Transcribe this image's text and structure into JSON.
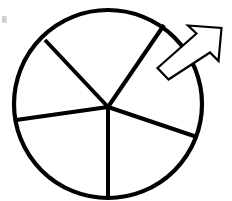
{
  "figure": {
    "kind": "pie-spinner-diagram",
    "width": 232,
    "height": 201,
    "background_color": "#ffffff",
    "stroke_color": "#000000",
    "title": "",
    "caption": ""
  },
  "chart_data": {
    "type": "pie",
    "title": "",
    "subtitle": "",
    "xlabel": "",
    "ylabel": "",
    "grid": false,
    "legend_position": "none",
    "slice_count": 5,
    "labels": [
      "sector-1",
      "sector-2",
      "sector-3",
      "sector-4",
      "sector-5"
    ],
    "values": [
      25,
      14,
      17,
      22,
      22
    ],
    "slice_fill": "#ffffff",
    "slice_stroke": "#000000",
    "boundary_angles_deg": [
      133,
      227,
      292,
      360,
      67
    ],
    "annotations": [
      {
        "name": "spinner-arrow",
        "text": "",
        "direction_deg": 42,
        "style": "hollow-outlined-arrow"
      }
    ]
  },
  "circle": {
    "center_x": 108,
    "center_y": 104,
    "radius_x": 94,
    "radius_y": 94,
    "stroke_width": 4.2,
    "fill": "#ffffff",
    "stroke": "#000000"
  },
  "hub": {
    "x": 108,
    "y": 107
  },
  "spokes": [
    {
      "name": "spoke-upper-left",
      "end_x": 45,
      "end_y": 40,
      "stroke_width": 4.0
    },
    {
      "name": "spoke-upper-right",
      "end_x": 164,
      "end_y": 25,
      "stroke_width": 4.0
    },
    {
      "name": "spoke-left",
      "end_x": 16,
      "end_y": 120,
      "stroke_width": 4.0
    },
    {
      "name": "spoke-lower-right",
      "end_x": 197,
      "end_y": 137,
      "stroke_width": 4.0
    },
    {
      "name": "spoke-bottom",
      "end_x": 108,
      "end_y": 197,
      "stroke_width": 4.0
    }
  ],
  "arrow": {
    "name": "spinner-arrow",
    "fill": "#ffffff",
    "stroke": "#000000",
    "stroke_width": 2.2,
    "points": "168.5,79.5 158.5,68.5 196.0,34.5 188.5,27.0 220.5,29.5 217.0,60.5 209.5,53.0 ",
    "tip_x": 219,
    "tip_y": 31,
    "tail_x": 168,
    "tail_y": 79
  },
  "corner_mark": {
    "name": "corner-speck",
    "x": 2,
    "y": 16,
    "width": 5,
    "height": 7,
    "color": "#d8d8d8"
  }
}
